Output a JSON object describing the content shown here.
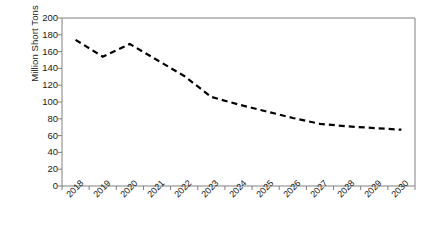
{
  "chart_data": {
    "type": "line",
    "title": "",
    "xlabel": "",
    "ylabel": "Million Short Tons",
    "categories": [
      "2018",
      "2019",
      "2020",
      "2021",
      "2022",
      "2023",
      "2024",
      "2025",
      "2026",
      "2027",
      "2028",
      "2029",
      "2030"
    ],
    "values": [
      174,
      154,
      169,
      150,
      131,
      106,
      97,
      89,
      81,
      74,
      71,
      69,
      67
    ],
    "series": [
      {
        "name": "Million Short Tons",
        "values": [
          174,
          154,
          169,
          150,
          131,
          106,
          97,
          89,
          81,
          74,
          71,
          69,
          67
        ]
      }
    ],
    "ylim": [
      0,
      200
    ],
    "ytick_step": 20,
    "ytick_labels": [
      "0",
      "20",
      "40",
      "60",
      "80",
      "100",
      "120",
      "140",
      "160",
      "180",
      "200"
    ],
    "grid": false,
    "legend": "none",
    "line_style": "dashed",
    "line_color": "#000000",
    "axis_color": "#808080",
    "background_color": "#ffffff"
  },
  "axis": {
    "y_label": "Million Short Tons"
  }
}
